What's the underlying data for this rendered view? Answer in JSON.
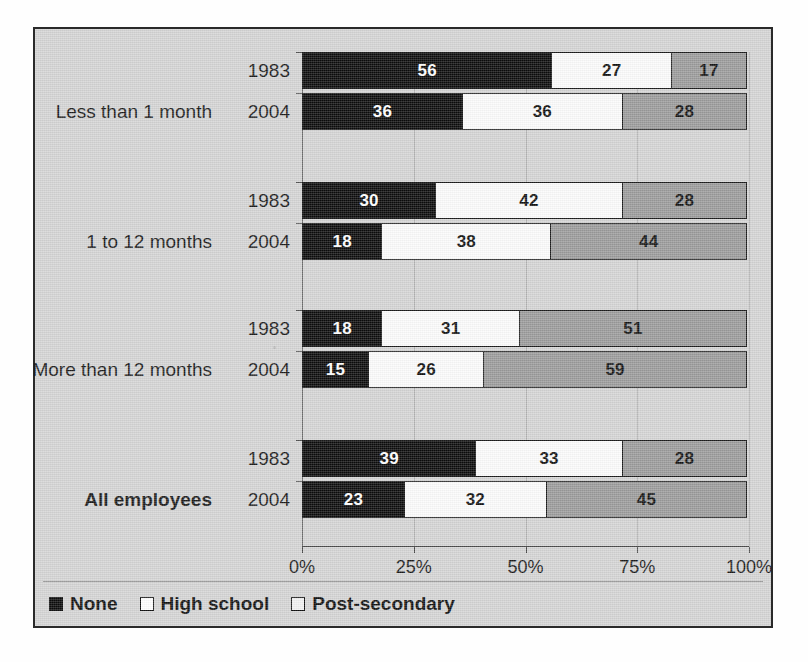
{
  "chart_data": {
    "type": "bar",
    "orientation": "horizontal",
    "stacked": true,
    "stacked_100pct": true,
    "title": "",
    "subtitle": "",
    "xlabel": "",
    "ylabel": "",
    "xlim": [
      0,
      100
    ],
    "xticks": [
      0,
      25,
      50,
      75,
      100
    ],
    "xtick_labels": [
      "0%",
      "25%",
      "50%",
      "75%",
      "100%"
    ],
    "grid": true,
    "legend_position": "bottom-left",
    "series": [
      {
        "name": "None",
        "color": "#0b0b0b",
        "values": [
          56,
          36,
          30,
          18,
          18,
          15,
          39,
          23
        ]
      },
      {
        "name": "High school",
        "color": "#fcfcfc",
        "values": [
          27,
          36,
          42,
          38,
          31,
          26,
          33,
          32
        ]
      },
      {
        "name": "Post-secondary",
        "color": "#9b9b9b",
        "values": [
          17,
          28,
          28,
          44,
          51,
          59,
          28,
          45
        ]
      }
    ],
    "groups": [
      {
        "label": "Less  than 1 month",
        "bold": false,
        "rows": [
          {
            "year": "1983",
            "none": 56,
            "high_school": 27,
            "post_secondary": 17
          },
          {
            "year": "2004",
            "none": 36,
            "high_school": 36,
            "post_secondary": 28
          }
        ]
      },
      {
        "label": "1 to 12 months",
        "bold": false,
        "rows": [
          {
            "year": "1983",
            "none": 30,
            "high_school": 42,
            "post_secondary": 28
          },
          {
            "year": "2004",
            "none": 18,
            "high_school": 38,
            "post_secondary": 44
          }
        ]
      },
      {
        "label": "More than 12 months",
        "bold": false,
        "rows": [
          {
            "year": "1983",
            "none": 18,
            "high_school": 31,
            "post_secondary": 51
          },
          {
            "year": "2004",
            "none": 15,
            "high_school": 26,
            "post_secondary": 59
          }
        ]
      },
      {
        "label": "All employees",
        "bold": true,
        "rows": [
          {
            "year": "1983",
            "none": 39,
            "high_school": 33,
            "post_secondary": 28
          },
          {
            "year": "2004",
            "none": 23,
            "high_school": 32,
            "post_secondary": 45
          }
        ]
      }
    ]
  },
  "legend": {
    "items": [
      {
        "label": "None",
        "swatch": "swatch-none"
      },
      {
        "label": "High school",
        "swatch": "swatch-hs"
      },
      {
        "label": "Post-secondary",
        "swatch": "swatch-ps"
      }
    ]
  },
  "source_note": ""
}
